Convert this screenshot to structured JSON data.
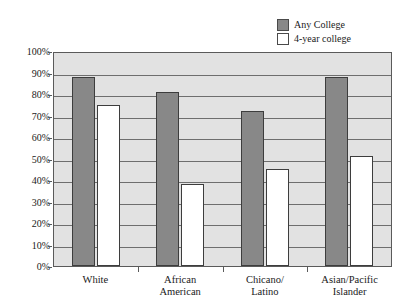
{
  "chart_data": {
    "type": "bar",
    "title": "",
    "xlabel": "",
    "ylabel": "",
    "ylim": [
      0,
      100
    ],
    "ytick_labels": [
      "100%",
      "90%",
      "80%",
      "70%",
      "60%",
      "50%",
      "40%",
      "30%",
      "20%",
      "10%",
      "0%"
    ],
    "ytick_values": [
      100,
      90,
      80,
      70,
      60,
      50,
      40,
      30,
      20,
      10,
      0
    ],
    "grid": true,
    "legend_position": "top-right",
    "categories": [
      "White",
      "African American",
      "Chicano/ Latino",
      "Asian/Pacific Islander"
    ],
    "category_lines": [
      [
        "White"
      ],
      [
        "African",
        "American"
      ],
      [
        "Chicano/",
        "Latino"
      ],
      [
        "Asian/Pacific",
        "Islander"
      ]
    ],
    "series": [
      {
        "name": "Any College",
        "color": "#888888",
        "values": [
          88,
          81,
          72,
          88
        ]
      },
      {
        "name": "4-year college",
        "color": "#ffffff",
        "values": [
          75,
          38,
          45,
          51
        ]
      }
    ]
  },
  "legend": {
    "items": [
      {
        "label": "Any College",
        "swatch": "gray-filled"
      },
      {
        "label": "4-year college",
        "swatch": "white-empty"
      }
    ]
  },
  "colors": {
    "plot_background": "#e2e2e2",
    "gridline": "#6e6e6e",
    "axis": "#5a5a5a",
    "bar_any_college": "#888888",
    "bar_four_year": "#ffffff",
    "bar_border": "#3d3d3d"
  }
}
